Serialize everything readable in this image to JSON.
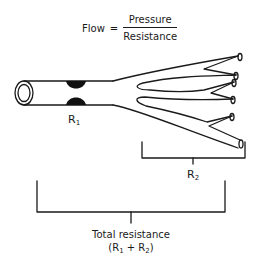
{
  "formula": {
    "lhs": "Flow",
    "operator": "=",
    "numerator": "Pressure",
    "denominator": "Resistance"
  },
  "labels": {
    "r1": {
      "base": "R",
      "sub": "1"
    },
    "r2": {
      "base": "R",
      "sub": "2"
    },
    "total": "Total resistance",
    "sum": {
      "open": "(R",
      "sub1": "1",
      "plus": " + R",
      "sub2": "2",
      "close": ")"
    }
  },
  "colors": {
    "stroke": "#1a1a1a",
    "background": "#ffffff"
  }
}
